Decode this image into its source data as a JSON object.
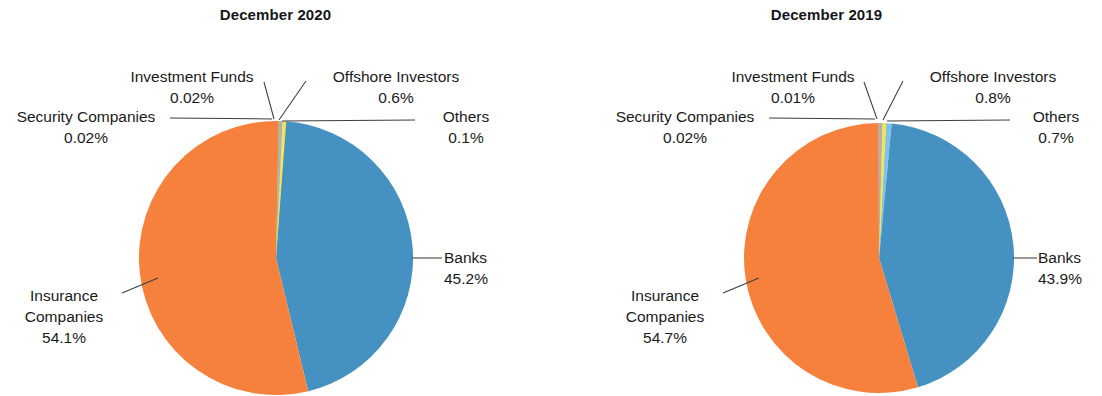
{
  "figure": {
    "background": "#ffffff",
    "text_color": "#1a1a1a"
  },
  "charts": [
    {
      "id": "december-2020",
      "title": "December 2020",
      "slices": [
        {
          "label": "Banks",
          "pct_text": "45.2%",
          "value": 45.2,
          "color": "#4591c2"
        },
        {
          "label": "Insurance\nCompanies",
          "pct_text": "54.1%",
          "value": 54.1,
          "color": "#f5813c"
        },
        {
          "label": "Security Companies",
          "pct_text": "0.02%",
          "value": 0.02,
          "color": "#b0b0b0"
        },
        {
          "label": "Investment Funds",
          "pct_text": "0.02%",
          "value": 0.02,
          "color": "#f2e45a"
        },
        {
          "label": "Offshore Investors",
          "pct_text": "0.6%",
          "value": 0.6,
          "color": "#f5e03a"
        },
        {
          "label": "Others",
          "pct_text": "0.1%",
          "value": 0.1,
          "color": "#7fc4e8"
        }
      ]
    },
    {
      "id": "december-2019",
      "title": "December 2019",
      "slices": [
        {
          "label": "Banks",
          "pct_text": "43.9%",
          "value": 43.9,
          "color": "#4591c2"
        },
        {
          "label": "Insurance\nCompanies",
          "pct_text": "54.7%",
          "value": 54.7,
          "color": "#f5813c"
        },
        {
          "label": "Security Companies",
          "pct_text": "0.02%",
          "value": 0.02,
          "color": "#b0b0b0"
        },
        {
          "label": "Investment Funds",
          "pct_text": "0.01%",
          "value": 0.01,
          "color": "#f2e45a"
        },
        {
          "label": "Offshore Investors",
          "pct_text": "0.8%",
          "value": 0.8,
          "color": "#f5e03a"
        },
        {
          "label": "Others",
          "pct_text": "0.7%",
          "value": 0.7,
          "color": "#7fc4e8"
        }
      ]
    }
  ],
  "chart_2020": {
    "title": "December 2020",
    "labels": {
      "investment_funds": {
        "name": "Investment Funds",
        "pct": "0.02%"
      },
      "offshore": {
        "name": "Offshore Investors",
        "pct": "0.6%"
      },
      "security": {
        "name": "Security Companies",
        "pct": "0.02%"
      },
      "others": {
        "name": "Others",
        "pct": "0.1%"
      },
      "banks": {
        "name": "Banks",
        "pct": "45.2%"
      },
      "insurance": {
        "name": "Insurance",
        "name2": "Companies",
        "pct": "54.1%"
      }
    }
  },
  "chart_2019": {
    "title": "December 2019",
    "labels": {
      "investment_funds": {
        "name": "Investment Funds",
        "pct": "0.01%"
      },
      "offshore": {
        "name": "Offshore Investors",
        "pct": "0.8%"
      },
      "security": {
        "name": "Security Companies",
        "pct": "0.02%"
      },
      "others": {
        "name": "Others",
        "pct": "0.7%"
      },
      "banks": {
        "name": "Banks",
        "pct": "43.9%"
      },
      "insurance": {
        "name": "Insurance",
        "name2": "Companies",
        "pct": "54.7%"
      }
    }
  },
  "chart_data": [
    {
      "type": "pie",
      "title": "December 2020",
      "categories": [
        "Banks",
        "Insurance Companies",
        "Security Companies",
        "Investment Funds",
        "Offshore Investors",
        "Others"
      ],
      "values": [
        45.2,
        54.1,
        0.02,
        0.02,
        0.6,
        0.1
      ],
      "labels": [
        "45.2%",
        "54.1%",
        "0.02%",
        "0.02%",
        "0.6%",
        "0.1%"
      ],
      "colors": [
        "#4591c2",
        "#f5813c",
        "#b0b0b0",
        "#f2e45a",
        "#f5e03a",
        "#7fc4e8"
      ],
      "legend": "none",
      "grid": false,
      "units": "percent"
    },
    {
      "type": "pie",
      "title": "December 2019",
      "categories": [
        "Banks",
        "Insurance Companies",
        "Security Companies",
        "Investment Funds",
        "Offshore Investors",
        "Others"
      ],
      "values": [
        43.9,
        54.7,
        0.02,
        0.01,
        0.8,
        0.7
      ],
      "labels": [
        "43.9%",
        "54.7%",
        "0.02%",
        "0.01%",
        "0.8%",
        "0.7%"
      ],
      "colors": [
        "#4591c2",
        "#f5813c",
        "#b0b0b0",
        "#f2e45a",
        "#f5e03a",
        "#7fc4e8"
      ],
      "legend": "none",
      "grid": false,
      "units": "percent"
    }
  ]
}
